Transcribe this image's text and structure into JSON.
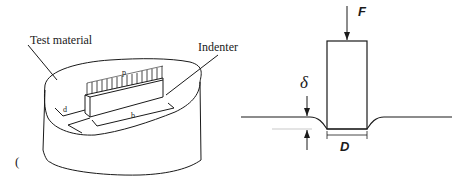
{
  "left_figure": {
    "label_material": "Test material",
    "label_indenter": "Indenter",
    "label_pressure": "p",
    "label_width": "d",
    "label_length": "b",
    "stray_mark": "("
  },
  "right_figure": {
    "label_force": "F",
    "label_depth": "δ",
    "label_diameter": "D"
  },
  "colors": {
    "line": "#1a1a1a",
    "background": "#ffffff",
    "faint": "#bbbbbb"
  }
}
